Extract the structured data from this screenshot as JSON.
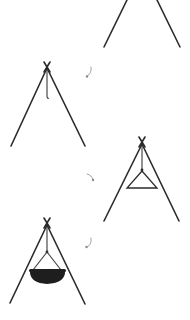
{
  "diagram": {
    "title": "",
    "steps": [
      {
        "id": 1,
        "label": "",
        "content": "tripod legs (top cropped)"
      },
      {
        "id": 2,
        "label": "",
        "content": "tripod with hanging hook"
      },
      {
        "id": 3,
        "label": "",
        "content": "tripod with triangular hanger"
      },
      {
        "id": 4,
        "label": "",
        "content": "tripod with hanging cooking pot"
      }
    ],
    "connectors": [
      {
        "from": 1,
        "to": 2,
        "icon": "curved-arrow-icon"
      },
      {
        "from": 2,
        "to": 3,
        "icon": "curved-arrow-icon"
      },
      {
        "from": 3,
        "to": 4,
        "icon": "curved-arrow-icon"
      }
    ],
    "colors": {
      "line": "#2b2b2b",
      "pot": "#1e1e1e",
      "arrow": "#9a9a9a",
      "background": "#ffffff"
    }
  }
}
